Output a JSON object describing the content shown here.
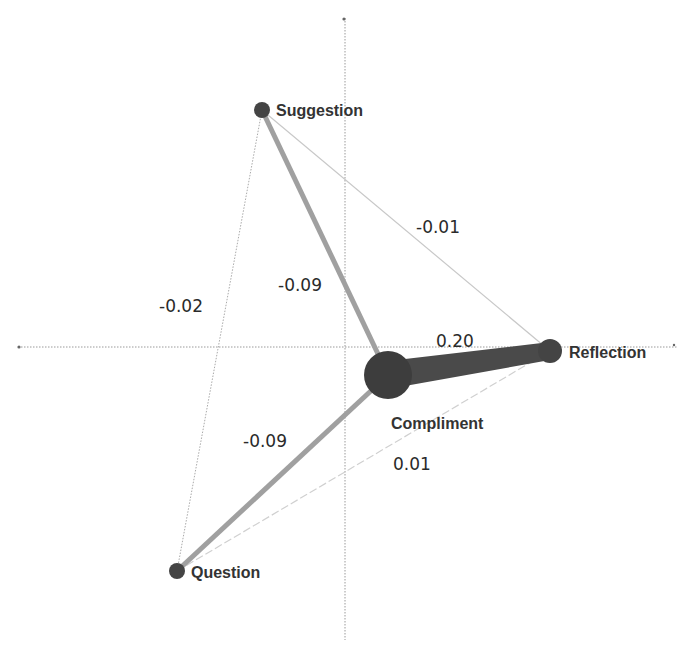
{
  "diagram": {
    "type": "network",
    "axes": {
      "horizontal": {
        "x1": 18,
        "y": 347,
        "x2": 678
      },
      "vertical": {
        "x": 345,
        "y1": 18,
        "y2": 640
      },
      "color": "#9a9a9a"
    },
    "colors": {
      "node": "#444444",
      "strong_edge": "#4a4a4a",
      "medium_edge": "#a0a0a0",
      "weak_edge": "#c8c8c8",
      "text": "#333333"
    },
    "nodes": [
      {
        "id": "suggestion",
        "label": "Suggestion",
        "x": 262,
        "y": 110,
        "r": 8
      },
      {
        "id": "reflection",
        "label": "Reflection",
        "x": 550,
        "y": 351,
        "r": 12
      },
      {
        "id": "compliment",
        "label": "Compliment",
        "x": 388,
        "y": 375,
        "r": 24
      },
      {
        "id": "question",
        "label": "Question",
        "x": 177,
        "y": 571,
        "r": 8
      }
    ],
    "edges": [
      {
        "from": "compliment",
        "to": "reflection",
        "weight": "0.20",
        "label": "0.20"
      },
      {
        "from": "compliment",
        "to": "suggestion",
        "weight": "-0.09",
        "label": "-0.09"
      },
      {
        "from": "compliment",
        "to": "question",
        "weight": "-0.09",
        "label": "-0.09"
      },
      {
        "from": "suggestion",
        "to": "reflection",
        "weight": "-0.01",
        "label": "-0.01"
      },
      {
        "from": "suggestion",
        "to": "question",
        "weight": "-0.02",
        "label": "-0.02"
      },
      {
        "from": "question",
        "to": "reflection",
        "weight": "0.01",
        "label": "0.01"
      }
    ],
    "edge_labels": {
      "compliment_reflection": "0.20",
      "compliment_suggestion": "-0.09",
      "compliment_question": "-0.09",
      "suggestion_reflection": "-0.01",
      "suggestion_question": "-0.02",
      "question_reflection": "0.01"
    },
    "node_labels": {
      "suggestion": "Suggestion",
      "reflection": "Reflection",
      "compliment": "Compliment",
      "question": "Question"
    }
  }
}
